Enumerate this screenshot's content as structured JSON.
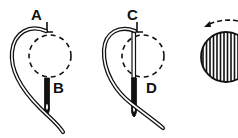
{
  "diagram": {
    "title": "",
    "colors": {
      "ink": "#111111",
      "background": "#ffffff"
    },
    "panels": [
      {
        "id": "panel-1",
        "description": "Needle inserted at point A emerging at B with thread looped around",
        "labels": [
          {
            "text": "A",
            "x": 31,
            "y": 20
          },
          {
            "text": "B",
            "x": 53,
            "y": 93
          }
        ]
      },
      {
        "id": "panel-2",
        "description": "Needle inserted at point C emerging at D with thread looped around",
        "labels": [
          {
            "text": "C",
            "x": 127,
            "y": 20
          },
          {
            "text": "D",
            "x": 146,
            "y": 93
          }
        ]
      },
      {
        "id": "panel-3",
        "description": "Finished satin-stitch filled circle with dashed arrow indicating direction of work (right to left)",
        "icons": [
          "direction-arrow-icon",
          "striped-disc-icon"
        ]
      }
    ]
  }
}
